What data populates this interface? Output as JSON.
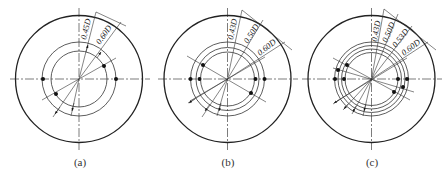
{
  "figure": {
    "panels": [
      {
        "id": "a",
        "caption": "(a)",
        "center": [
          79,
          79
        ],
        "outer_radius": 63.5,
        "ring_labels": [
          "0.45D",
          "0.60D"
        ],
        "ring_radii": [
          28,
          37
        ]
      },
      {
        "id": "b",
        "caption": "(b)",
        "center": [
          227.5,
          79
        ],
        "outer_radius": 63.5,
        "ring_labels": [
          "0.43D",
          "0.50D",
          "0.60D"
        ],
        "ring_radii": [
          27,
          31.5,
          37
        ]
      },
      {
        "id": "c",
        "caption": "(c)",
        "center": [
          371.5,
          79
        ],
        "outer_radius": 63.5,
        "ring_labels": [
          "0.43D",
          "0.50D",
          "0.53D",
          "0.60D"
        ],
        "ring_radii": [
          26.5,
          30,
          33.5,
          37
        ]
      }
    ]
  }
}
